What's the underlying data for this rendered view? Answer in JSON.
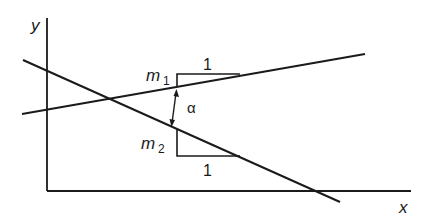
{
  "diagram": {
    "axes": {
      "x_label": "x",
      "y_label": "y"
    },
    "lines": [
      {
        "name": "line-1",
        "slope_label": "m",
        "slope_sub": "1",
        "run_label": "1"
      },
      {
        "name": "line-2",
        "slope_label": "m",
        "slope_sub": "2",
        "run_label": "1"
      }
    ],
    "angle_label": "α",
    "colors": {
      "stroke": "#1a1a1a",
      "background": "#ffffff"
    }
  }
}
